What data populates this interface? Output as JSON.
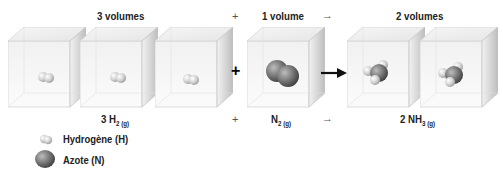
{
  "top_labels": {
    "reactant1": "3 volumes",
    "plus": "+",
    "reactant2": "1 volume",
    "arrow": "→",
    "product": "2 volumes"
  },
  "equation": {
    "reactant1_coef": "3 H",
    "reactant1_sub": "2 (g)",
    "plus": "+",
    "reactant2": "N",
    "reactant2_sub": "2 (g)",
    "arrow": "→",
    "product": "2 NH",
    "product_sub": "3 (g)"
  },
  "middle": {
    "plus": "+"
  },
  "legend": {
    "hydrogen": "Hydrogène (H)",
    "nitrogen": "Azote (N)"
  },
  "colors": {
    "hydrogen": "#d8d8d8",
    "nitrogen": "#6e6e6e",
    "cube_edge": "#c8c8c8"
  }
}
